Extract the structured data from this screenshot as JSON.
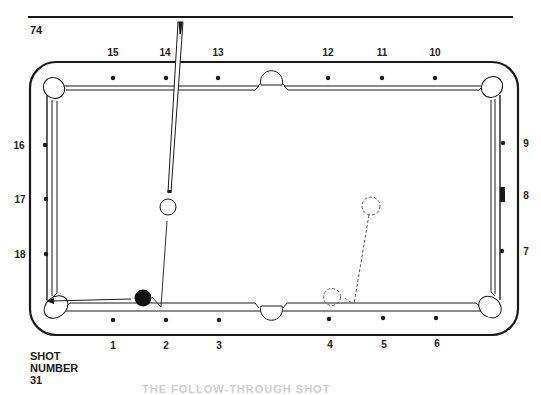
{
  "page": {
    "number": "74"
  },
  "shot": {
    "line1": "SHOT",
    "line2": "NUMBER",
    "line3": "31"
  },
  "caption_partial": "THE FOLLOW-THROUGH SHOT",
  "diamonds": {
    "top": [
      "15",
      "14",
      "13",
      "12",
      "11",
      "10"
    ],
    "bottom": [
      "1",
      "2",
      "3",
      "4",
      "5",
      "6"
    ],
    "left": [
      "16",
      "17",
      "18"
    ],
    "right": [
      "9",
      "8",
      "7"
    ]
  },
  "colors": {
    "ink": "#1a1a1a",
    "paper": "#ffffff",
    "dashed": "#555555"
  },
  "elements": {
    "cue_ball": "white cue ball (hollow circle) near diamond 14",
    "object_ball": "black object ball near bottom-left rail at diamond 2",
    "ghost_ball_start": "dashed circle near diamond 8 line",
    "ghost_ball_end": "dashed circle near diamond 4",
    "marker": "rectangular marker at diamond 8"
  }
}
